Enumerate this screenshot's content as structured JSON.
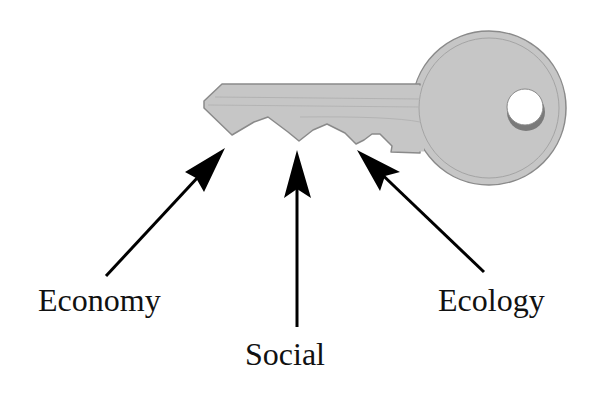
{
  "diagram": {
    "labels": {
      "economy": "Economy",
      "social": "Social",
      "ecology": "Ecology"
    },
    "colors": {
      "key_fill": "#c6c6c6",
      "key_outline": "#8a8a8a",
      "key_detail": "#a8a8a8",
      "arrow": "#000000",
      "text": "#111111",
      "background": "#ffffff"
    },
    "arrows": [
      {
        "name": "economy",
        "from": [
          106,
          276
        ],
        "to": [
          225,
          148
        ]
      },
      {
        "name": "social",
        "from": [
          297,
          327
        ],
        "to": [
          297,
          150
        ]
      },
      {
        "name": "ecology",
        "from": [
          484,
          272
        ],
        "to": [
          357,
          150
        ]
      }
    ]
  }
}
